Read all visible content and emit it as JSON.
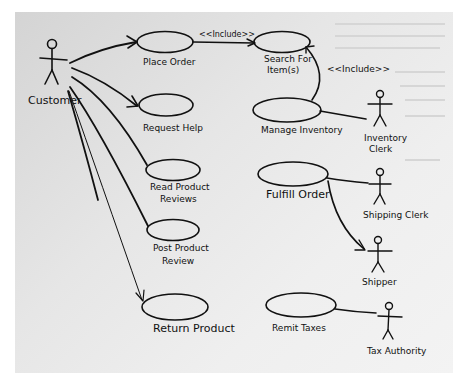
{
  "diagram": {
    "type": "use-case",
    "style": "hand-drawn",
    "actors": [
      {
        "id": "customer",
        "label": "Customer"
      },
      {
        "id": "inventory_clerk",
        "label_lines": [
          "Inventory",
          "Clerk"
        ]
      },
      {
        "id": "shipping_clerk",
        "label": "Shipping Clerk"
      },
      {
        "id": "shipper",
        "label": "Shipper"
      },
      {
        "id": "tax_authority",
        "label": "Tax Authority"
      }
    ],
    "use_cases": [
      {
        "id": "place_order",
        "label": "Place Order"
      },
      {
        "id": "search_items",
        "label_lines": [
          "Search For",
          "Item(s)"
        ]
      },
      {
        "id": "request_help",
        "label": "Request Help"
      },
      {
        "id": "manage_inventory",
        "label": "Manage Inventory"
      },
      {
        "id": "read_reviews",
        "label_lines": [
          "Read Product",
          "Reviews"
        ]
      },
      {
        "id": "post_review",
        "label_lines": [
          "Post Product",
          "Review"
        ]
      },
      {
        "id": "fulfill_order",
        "label": "Fulfill Order"
      },
      {
        "id": "return_product",
        "label": "Return Product"
      },
      {
        "id": "remit_taxes",
        "label": "Remit Taxes"
      }
    ],
    "relationships": [
      {
        "from": "customer",
        "to": "place_order",
        "kind": "association-arrow"
      },
      {
        "from": "customer",
        "to": "request_help",
        "kind": "association-arrow"
      },
      {
        "from": "customer",
        "to": "read_reviews",
        "kind": "association"
      },
      {
        "from": "customer",
        "to": "post_review",
        "kind": "association"
      },
      {
        "from": "customer",
        "to": "return_product",
        "kind": "association-arrow"
      },
      {
        "from": "place_order",
        "to": "search_items",
        "kind": "include",
        "label": "<<Include>>"
      },
      {
        "from": "manage_inventory",
        "to": "search_items",
        "kind": "include",
        "label": "<<Include>>"
      },
      {
        "from": "inventory_clerk",
        "to": "manage_inventory",
        "kind": "association"
      },
      {
        "from": "fulfill_order",
        "to": "shipping_clerk",
        "kind": "association"
      },
      {
        "from": "fulfill_order",
        "to": "shipper",
        "kind": "association-arrow"
      },
      {
        "from": "remit_taxes",
        "to": "tax_authority",
        "kind": "association"
      }
    ]
  }
}
